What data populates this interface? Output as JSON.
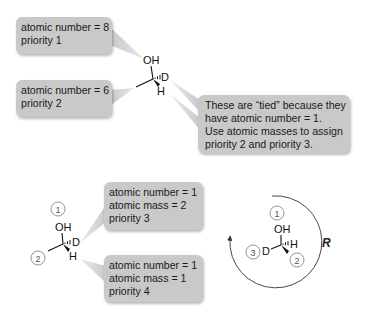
{
  "callouts": {
    "top_oxygen": {
      "lines": [
        "atomic number = 8",
        "priority 1"
      ]
    },
    "top_carbon": {
      "lines": [
        "atomic number = 6",
        "priority 2"
      ]
    },
    "tie_note": {
      "lines": [
        "These are “tied” because they",
        "have atomic number = 1.",
        "Use atomic masses to assign",
        "priority 2 and priority 3."
      ]
    },
    "deuterium": {
      "lines": [
        "atomic number = 1",
        "atomic mass = 2",
        "priority 3"
      ]
    },
    "hydrogen": {
      "lines": [
        "atomic number = 1",
        "atomic mass = 1",
        "priority 4"
      ]
    }
  },
  "molecules": {
    "top": {
      "oh": "OH",
      "d": "D",
      "h": "H"
    },
    "bottom_left": {
      "oh": "OH",
      "d": "D",
      "h": "H",
      "priority_labels": [
        "1",
        "2"
      ]
    },
    "bottom_right": {
      "oh": "OH",
      "d": "D",
      "h": "H",
      "priority_labels": [
        "1",
        "3",
        "2"
      ]
    }
  },
  "configuration": {
    "label": "R",
    "rotation": "clockwise"
  },
  "colors": {
    "callout_fill": "#c9c9c9",
    "tail_fill": "#d4d4d4",
    "bond": "#111111",
    "arc": "#333333"
  }
}
